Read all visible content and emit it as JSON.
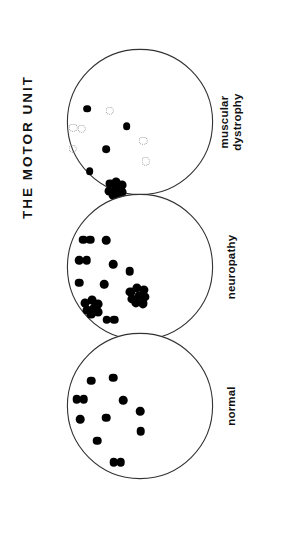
{
  "figure": {
    "title": "THE  MOTOR  UNIT",
    "background_color": "#ffffff",
    "ink_color": "#000000",
    "outline_color": "#333333",
    "faint_color": "#9a9a9a"
  },
  "panels": [
    {
      "id": "muscular-dystrophy",
      "label_line1": "muscular",
      "label_line2": "dystrophy",
      "order": 1
    },
    {
      "id": "neuropathy",
      "label_line1": "neuropathy",
      "label_line2": "",
      "order": 2
    },
    {
      "id": "normal",
      "label_line1": "normal",
      "label_line2": "",
      "order": 3
    }
  ],
  "chart_data": {
    "type": "scatter",
    "title": "THE  MOTOR  UNIT",
    "subtitle": "",
    "xlabel": "",
    "ylabel": "",
    "grid": false,
    "legend_position": "right",
    "xlim": [
      0,
      100
    ],
    "ylim": [
      0,
      100
    ],
    "marker_kinds": {
      "solid": "innervated / normal fibre, filled black dot",
      "hollow": "atrophied fibre, faint dotted outline ring",
      "cluster": "grouped fibre-type clump (fibre type grouping)"
    },
    "series": [
      {
        "name": "muscular dystrophy",
        "panel": "muscular-dystrophy",
        "legend_label_line1": "muscular",
        "legend_label_line2": "dystrophy",
        "solid_count": 5,
        "hollow_count": 6,
        "cluster_count": 1,
        "points": [
          {
            "x": 14.5,
            "y": 41.0,
            "kind": "solid",
            "r": 2.6
          },
          {
            "x": 41.0,
            "y": 53.0,
            "kind": "solid",
            "r": 2.6
          },
          {
            "x": 27.0,
            "y": 68.5,
            "kind": "solid",
            "r": 2.6
          },
          {
            "x": 16.0,
            "y": 83.0,
            "kind": "solid",
            "r": 2.6
          },
          {
            "x": 29.5,
            "y": 42.5,
            "kind": "hollow",
            "r": 2.9
          },
          {
            "x": 5.0,
            "y": 54.0,
            "kind": "hollow",
            "r": 2.9
          },
          {
            "x": 10.5,
            "y": 54.5,
            "kind": "hollow",
            "r": 2.9
          },
          {
            "x": 4.5,
            "y": 68.0,
            "kind": "hollow",
            "r": 2.9
          },
          {
            "x": 52.0,
            "y": 62.5,
            "kind": "hollow",
            "r": 2.9
          },
          {
            "x": 54.0,
            "y": 76.5,
            "kind": "hollow",
            "r": 2.9
          }
        ],
        "clusters": [
          {
            "x": 33.5,
            "y": 95.0,
            "members": [
              {
                "dx": -4.0,
                "dy": -3.4,
                "r": 3.0
              },
              {
                "dx": 0.6,
                "dy": -4.6,
                "r": 3.0
              },
              {
                "dx": 4.6,
                "dy": -2.4,
                "r": 3.0
              },
              {
                "dx": -4.6,
                "dy": 1.6,
                "r": 3.0
              },
              {
                "dx": 0.0,
                "dy": 0.4,
                "r": 3.0
              },
              {
                "dx": 4.4,
                "dy": 2.4,
                "r": 3.0
              },
              {
                "dx": -2.0,
                "dy": 4.6,
                "r": 3.0
              },
              {
                "dx": 2.6,
                "dy": 5.2,
                "r": 3.0
              }
            ]
          }
        ]
      },
      {
        "name": "neuropathy",
        "panel": "neuropathy",
        "legend_label_line1": "neuropathy",
        "legend_label_line2": "",
        "solid_count": 6,
        "doublet_count": 3,
        "cluster_count": 2,
        "points": [
          {
            "x": 27.0,
            "y": 32.0,
            "kind": "solid",
            "r": 2.9
          },
          {
            "x": 32.0,
            "y": 48.0,
            "kind": "solid",
            "r": 2.9
          },
          {
            "x": 43.0,
            "y": 53.0,
            "kind": "solid",
            "r": 2.9
          },
          {
            "x": 9.0,
            "y": 60.5,
            "kind": "solid",
            "r": 2.9
          },
          {
            "x": 26.0,
            "y": 61.5,
            "kind": "solid",
            "r": 2.9
          }
        ],
        "doublets": [
          {
            "x": 14.0,
            "y": 31.5,
            "gap": 4.6,
            "r": 2.9,
            "angle": 0
          },
          {
            "x": 11.5,
            "y": 45.5,
            "gap": 4.8,
            "r": 2.9,
            "angle": 0
          },
          {
            "x": 30.0,
            "y": 85.5,
            "gap": 4.8,
            "r": 2.9,
            "angle": 0
          }
        ],
        "clusters": [
          {
            "x": 48.5,
            "y": 69.0,
            "members": [
              {
                "dx": -5.0,
                "dy": -2.0,
                "r": 3.1
              },
              {
                "dx": -0.6,
                "dy": -4.6,
                "r": 3.1
              },
              {
                "dx": 4.4,
                "dy": -3.4,
                "r": 3.1
              },
              {
                "dx": -4.0,
                "dy": 2.6,
                "r": 3.1
              },
              {
                "dx": 0.6,
                "dy": 0.6,
                "r": 3.1
              },
              {
                "dx": 5.0,
                "dy": 1.4,
                "r": 3.1
              },
              {
                "dx": -1.4,
                "dy": 5.4,
                "r": 3.1
              },
              {
                "dx": 3.4,
                "dy": 5.6,
                "r": 3.1
              }
            ]
          },
          {
            "x": 17.5,
            "y": 76.5,
            "members": [
              {
                "dx": -4.4,
                "dy": -2.4,
                "r": 3.0
              },
              {
                "dx": 0.4,
                "dy": -4.2,
                "r": 3.0
              },
              {
                "dx": 4.4,
                "dy": -1.4,
                "r": 3.0
              },
              {
                "dx": -3.2,
                "dy": 2.6,
                "r": 3.0
              },
              {
                "dx": 1.4,
                "dy": 1.4,
                "r": 3.0
              },
              {
                "dx": 4.0,
                "dy": 4.0,
                "r": 3.0
              },
              {
                "dx": -0.6,
                "dy": 5.6,
                "r": 3.0
              }
            ]
          }
        ]
      },
      {
        "name": "normal",
        "panel": "normal",
        "legend_label_line1": "normal",
        "legend_label_line2": "",
        "solid_count": 9,
        "doublet_count": 2,
        "cluster_count": 0,
        "points": [
          {
            "x": 17.0,
            "y": 33.0,
            "kind": "solid",
            "r": 2.9
          },
          {
            "x": 32.0,
            "y": 31.0,
            "kind": "solid",
            "r": 2.9
          },
          {
            "x": 38.5,
            "y": 46.0,
            "kind": "solid",
            "r": 2.9
          },
          {
            "x": 50.0,
            "y": 53.5,
            "kind": "solid",
            "r": 2.9
          },
          {
            "x": 9.5,
            "y": 59.0,
            "kind": "solid",
            "r": 2.9
          },
          {
            "x": 27.0,
            "y": 58.0,
            "kind": "solid",
            "r": 2.9
          },
          {
            "x": 50.5,
            "y": 67.0,
            "kind": "solid",
            "r": 2.9
          },
          {
            "x": 21.0,
            "y": 73.5,
            "kind": "solid",
            "r": 2.9
          }
        ],
        "doublets": [
          {
            "x": 9.5,
            "y": 45.5,
            "gap": 4.8,
            "r": 2.9,
            "angle": 0
          },
          {
            "x": 34.5,
            "y": 88.0,
            "gap": 4.8,
            "r": 2.9,
            "angle": 0
          }
        ]
      }
    ]
  }
}
